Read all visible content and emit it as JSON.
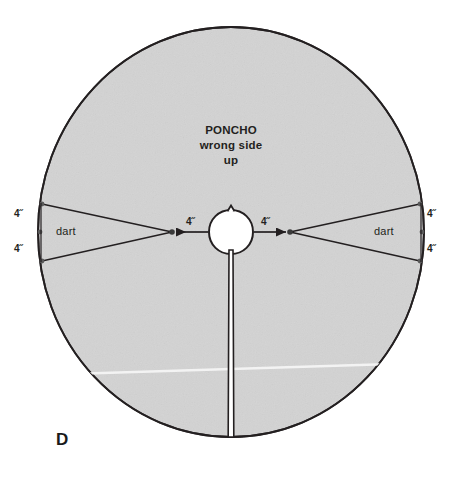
{
  "figure": {
    "plate_label": "D",
    "title_lines": [
      "PONCHO",
      "wrong side",
      "up"
    ],
    "colors": {
      "fabric_fill": "#d3d3d3",
      "outline": "#231f20",
      "background": "#ffffff",
      "text": "#231f20",
      "crease_line": "#f2f2f2"
    }
  },
  "labels": {
    "dart_left": "dart",
    "dart_right": "dart",
    "measure_center_left": "4˝",
    "measure_center_right": "4˝",
    "measure_left_upper": "4˝",
    "measure_left_lower": "4˝",
    "measure_right_upper": "4˝",
    "measure_right_lower": "4˝"
  },
  "geometry": {
    "circle": {
      "cx": 231,
      "cy": 232,
      "rx": 193,
      "ry": 205
    },
    "neck": {
      "cx": 231,
      "cy": 232,
      "r": 22
    },
    "dart_point_left": {
      "x": 172,
      "y": 232
    },
    "dart_point_right": {
      "x": 290,
      "y": 232
    },
    "front_slit": {
      "x": 231,
      "y_top": 254,
      "y_bottom": 437,
      "width": 4
    }
  },
  "measurements": {
    "unit": "inch",
    "neck_to_dart_point": 4,
    "dart_leg_half_spread": 4,
    "dart_count": 2
  }
}
